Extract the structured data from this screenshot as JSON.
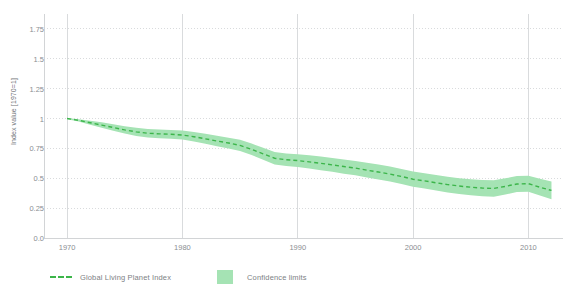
{
  "chart_data": {
    "type": "line",
    "title": "",
    "xlabel": "",
    "ylabel": "Index value [1970=1]",
    "xlim": [
      1968,
      2013
    ],
    "ylim": [
      0,
      1.875
    ],
    "grid": true,
    "legend_position": "bottom-left",
    "y_ticks": [
      "0.0",
      "0.25",
      "0.5",
      "0.75",
      "1",
      "1.25",
      "1.5",
      "1.75"
    ],
    "y_tick_values": [
      0,
      0.25,
      0.5,
      0.75,
      1,
      1.25,
      1.5,
      1.75
    ],
    "x_ticks": [
      "1970",
      "1980",
      "1990",
      "2000",
      "2010"
    ],
    "x_tick_values": [
      1970,
      1980,
      1990,
      2000,
      2010
    ],
    "x": [
      1970,
      1971,
      1972,
      1973,
      1974,
      1975,
      1976,
      1977,
      1978,
      1979,
      1980,
      1981,
      1982,
      1983,
      1984,
      1985,
      1986,
      1987,
      1988,
      1989,
      1990,
      1991,
      1992,
      1993,
      1994,
      1995,
      1996,
      1997,
      1998,
      1999,
      2000,
      2001,
      2002,
      2003,
      2004,
      2005,
      2006,
      2007,
      2008,
      2009,
      2010,
      2011,
      2012
    ],
    "series": [
      {
        "name": "Global Living Planet Index",
        "style": "dashed",
        "color": "#3cb54a",
        "values": [
          1.0,
          0.985,
          0.965,
          0.945,
          0.925,
          0.905,
          0.888,
          0.877,
          0.872,
          0.868,
          0.862,
          0.848,
          0.83,
          0.812,
          0.795,
          0.775,
          0.742,
          0.705,
          0.668,
          0.655,
          0.648,
          0.637,
          0.625,
          0.612,
          0.598,
          0.585,
          0.568,
          0.552,
          0.535,
          0.515,
          0.492,
          0.478,
          0.462,
          0.447,
          0.435,
          0.425,
          0.418,
          0.415,
          0.432,
          0.452,
          0.455,
          0.425,
          0.398
        ]
      },
      {
        "name": "Confidence limits",
        "style": "band",
        "color": "#a5e3b4",
        "upper": [
          1.005,
          0.995,
          0.982,
          0.968,
          0.952,
          0.936,
          0.922,
          0.912,
          0.908,
          0.905,
          0.9,
          0.888,
          0.872,
          0.856,
          0.84,
          0.822,
          0.79,
          0.755,
          0.72,
          0.708,
          0.702,
          0.692,
          0.682,
          0.67,
          0.658,
          0.645,
          0.63,
          0.615,
          0.598,
          0.578,
          0.556,
          0.542,
          0.527,
          0.513,
          0.501,
          0.492,
          0.486,
          0.484,
          0.5,
          0.518,
          0.522,
          0.495,
          0.472
        ],
        "lower": [
          0.995,
          0.975,
          0.948,
          0.922,
          0.898,
          0.874,
          0.854,
          0.842,
          0.836,
          0.831,
          0.824,
          0.808,
          0.788,
          0.768,
          0.75,
          0.728,
          0.694,
          0.655,
          0.616,
          0.602,
          0.594,
          0.582,
          0.568,
          0.554,
          0.538,
          0.525,
          0.506,
          0.489,
          0.472,
          0.452,
          0.428,
          0.414,
          0.397,
          0.381,
          0.369,
          0.358,
          0.35,
          0.346,
          0.364,
          0.386,
          0.388,
          0.355,
          0.324
        ]
      }
    ],
    "legend": [
      {
        "label": "Global Living Planet Index",
        "marker": "dashed-line",
        "color": "#3cb54a"
      },
      {
        "label": "Confidence limits",
        "marker": "filled-square",
        "color": "#a5e3b4"
      }
    ],
    "colors": {
      "line": "#3cb54a",
      "band": "#a5e3b4",
      "axis": "#d2d4d6",
      "grid": "#d9dbdd",
      "tick_text": "#8a8e92",
      "axis_title": "#6f7377",
      "background": "#ffffff"
    }
  }
}
